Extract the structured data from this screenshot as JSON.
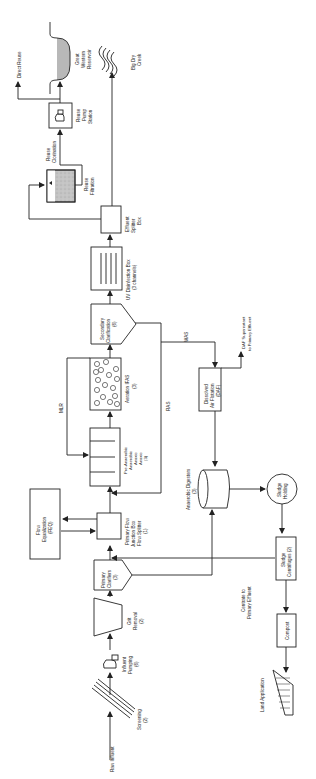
{
  "diagram": {
    "orientation": "rotated-90-ccw",
    "nodes": {
      "raw_influent": {
        "label": "Raw Influent"
      },
      "screening": {
        "label": "Screening",
        "count": "(2)"
      },
      "influent_pumping": {
        "label1": "Influent",
        "label2": "Pumping",
        "count": "(6)"
      },
      "grit_removal": {
        "label1": "Grit",
        "label2": "Removal",
        "count": "(2)"
      },
      "primary_clarifiers": {
        "label1": "Primary",
        "label2": "Clarifiers",
        "count": "(3)"
      },
      "primary_flow_junction": {
        "label1": "Primary Flow",
        "label2": "Junction Box",
        "label3": "Flow Splitter",
        "count": "(1)"
      },
      "flow_equalization": {
        "label1": "Flow",
        "label2": "Equalization",
        "count": "(FEQ)"
      },
      "pre_anaerobic": {
        "label1": "Pre-Anaerobic",
        "label2": "Anaerobic",
        "label3": "Anoxic",
        "label4": "Anoxic",
        "count": "(3)"
      },
      "aeration": {
        "label": "Aeration IFAS",
        "count": "(3)"
      },
      "secondary_clarification": {
        "label1": "Secondary",
        "label2": "Clarification",
        "count": "(6)"
      },
      "uv_disinfection": {
        "label": "UV Disinfection Box",
        "count": "(3 channels)"
      },
      "effluent_splitter": {
        "label1": "Effluent",
        "label2": "Splitter",
        "label3": "Box"
      },
      "reuse_filtration": {
        "label1": "Reuse",
        "label2": "Filtration"
      },
      "reuse_chlorination": {
        "label1": "Reuse",
        "label2": "Clorination"
      },
      "reuse_pump_station": {
        "label1": "Reuse",
        "label2": "Pump",
        "label3": "Station"
      },
      "direct_reuse": {
        "label": "Direct Reuse"
      },
      "great_western_reservoir": {
        "label1": "Great",
        "label2": "Western",
        "label3": "Reservoir"
      },
      "big_dry_creek": {
        "label1": "Big Dry",
        "label2": "Creek"
      },
      "daf": {
        "label1": "Dissolved",
        "label2": "Air Flotation",
        "count": "(DAF)"
      },
      "daf_supernatant": {
        "label1": "DAF Supernatant",
        "label2": "to Primary Effluent"
      },
      "anaerobic_digesters": {
        "label": "Anaerobic Digesters",
        "count": "(3)"
      },
      "sludge_holding": {
        "label1": "Sludge",
        "label2": "Holding"
      },
      "sludge_centrifuges": {
        "label1": "Sludge",
        "label2": "Centrifuges (2)"
      },
      "centrate": {
        "label1": "Centrate to",
        "label2": "Primary Effluent"
      },
      "compost": {
        "label": "Compost"
      },
      "land_application": {
        "label": "Land Application"
      }
    },
    "flow_labels": {
      "mlr": "MLR",
      "ras": "RAS",
      "was": "WAS"
    },
    "colors": {
      "line": "#222222",
      "water_fill": "#b8b8b8",
      "background": "#ffffff"
    }
  }
}
